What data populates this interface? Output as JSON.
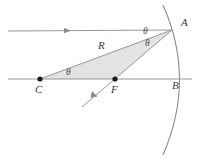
{
  "figure": {
    "background_color": "#ffffff",
    "shade_color": "#e3e3e3",
    "line_color": "#8c8c8c",
    "dot_color": "#1a1a1a",
    "label_color": "#3a3a3a",
    "width": 199,
    "height": 161
  },
  "labels": {
    "point_a": "A",
    "point_b": "B",
    "point_c": "C",
    "point_f": "F",
    "radius": "R",
    "theta_vertex_top": "θ",
    "theta_vertex_bottom": "θ",
    "theta_center": "θ"
  },
  "geometry": {
    "point_a": {
      "x": 172,
      "y": 30
    },
    "point_b": {
      "x": 182,
      "y": 79
    },
    "point_c": {
      "x": 40,
      "y": 79
    },
    "point_f": {
      "x": 115,
      "y": 79
    },
    "incoming_ray": {
      "x1": 8,
      "y1": 31,
      "x2": 172,
      "y2": 30
    },
    "incoming_arrow_at": {
      "x": 68,
      "y": 31
    },
    "axis_line": {
      "x1": 8,
      "y1": 79,
      "x2": 192,
      "y2": 79
    },
    "reflected_ray": {
      "x1": 172,
      "y1": 30,
      "x2": 82,
      "y2": 107
    },
    "reflected_arrow_at": {
      "x": 100,
      "y": 92
    },
    "radius_line": {
      "x1": 40,
      "y1": 79,
      "x2": 172,
      "y2": 30
    },
    "mirror_arc": {
      "start": {
        "x": 163,
        "y": 5
      },
      "end": {
        "x": 163,
        "y": 155
      },
      "vertex": {
        "x": 182,
        "y": 79
      }
    },
    "shaded_triangle": [
      {
        "x": 40,
        "y": 79
      },
      {
        "x": 172,
        "y": 30
      },
      {
        "x": 115,
        "y": 79
      }
    ]
  },
  "label_positions": {
    "point_a": {
      "x": 181,
      "y": 26
    },
    "point_b": {
      "x": 172,
      "y": 89
    },
    "point_c": {
      "x": 38,
      "y": 92
    },
    "point_f": {
      "x": 114,
      "y": 92
    },
    "radius": {
      "x": 101,
      "y": 48
    },
    "theta_vertex_top": {
      "x": 146,
      "y": 33
    },
    "theta_vertex_bottom": {
      "x": 148,
      "y": 45
    },
    "theta_center": {
      "x": 69,
      "y": 74
    }
  }
}
